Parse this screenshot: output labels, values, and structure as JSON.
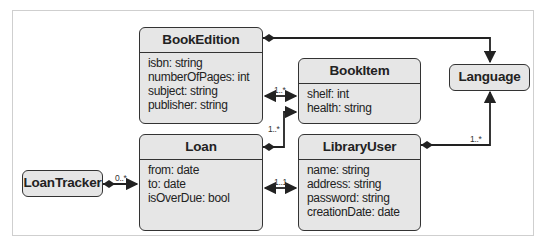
{
  "diagram": {
    "type": "uml-class-diagram",
    "classes": [
      {
        "id": "BookEdition",
        "name": "BookEdition",
        "attributes": [
          "isbn: string",
          "numberOfPages: int",
          "subject: string",
          "publisher: string"
        ]
      },
      {
        "id": "BookItem",
        "name": "BookItem",
        "attributes": [
          "shelf: int",
          "health: string"
        ]
      },
      {
        "id": "Language",
        "name": "Language",
        "attributes": []
      },
      {
        "id": "Loan",
        "name": "Loan",
        "attributes": [
          "from: date",
          "to: date",
          "isOverDue: bool"
        ]
      },
      {
        "id": "LibraryUser",
        "name": "LibraryUser",
        "attributes": [
          "name: string",
          "address: string",
          "password: string",
          "creationDate: date"
        ]
      },
      {
        "id": "LoanTracker",
        "name": "LoanTracker",
        "attributes": []
      }
    ],
    "relationships": [
      {
        "from": "BookEdition",
        "to": "Language",
        "kind": "composition",
        "multiplicity": ""
      },
      {
        "from": "BookEdition",
        "to": "BookItem",
        "kind": "bidirectional",
        "multiplicity": "1..*"
      },
      {
        "from": "Loan",
        "to": "BookItem",
        "kind": "composition",
        "multiplicity": "1..*"
      },
      {
        "from": "LibraryUser",
        "to": "Language",
        "kind": "composition",
        "multiplicity": "1..*"
      },
      {
        "from": "Loan",
        "to": "LibraryUser",
        "kind": "bidirectional",
        "multiplicity": "1..1"
      },
      {
        "from": "LoanTracker",
        "to": "Loan",
        "kind": "composition",
        "multiplicity": "0..*"
      }
    ],
    "labels": {
      "bookedition_bookitem": "1..*",
      "loan_bookitem": "1..*",
      "libraryuser_language": "1..*",
      "loan_libraryuser": "1..1",
      "loantracker_loan": "0..*"
    },
    "colors": {
      "box_fill": "#e6e6e6",
      "stroke": "#333333",
      "frame": "#cfcfcf"
    }
  }
}
